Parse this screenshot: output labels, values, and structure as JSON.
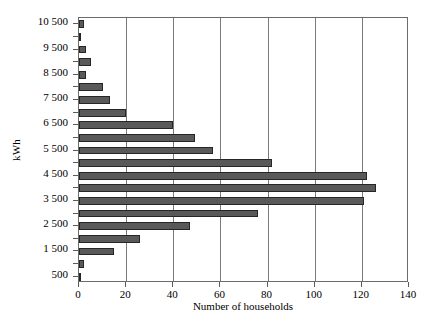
{
  "chart_data": {
    "type": "bar",
    "orientation": "horizontal",
    "title": "",
    "xlabel": "Number of households",
    "ylabel": "kWh",
    "xlim": [
      0,
      140
    ],
    "ylim_note": "categorical bins from 500 to 10 500 kWh in 500 kWh steps",
    "grid": "vertical gridlines at every x tick",
    "legend": "none",
    "xticks": [
      0,
      20,
      40,
      60,
      80,
      100,
      120,
      140
    ],
    "xticklabels": [
      "0",
      "20",
      "40",
      "60",
      "80",
      "100",
      "120",
      "140"
    ],
    "categories": [
      "10 500",
      "10 000",
      "9 500",
      "9 000",
      "8 500",
      "8 000",
      "7 500",
      "7 000",
      "6 500",
      "6 000",
      "5 500",
      "5 000",
      "4 500",
      "4 000",
      "3 500",
      "3 000",
      "2 500",
      "2 000",
      "1 500",
      "1 000",
      "500"
    ],
    "yticklabels_shown": [
      "10 500",
      "9 500",
      "8 500",
      "7 500",
      "6 500",
      "5 500",
      "4 500",
      "3 500",
      "2 500",
      "1 500",
      "500"
    ],
    "values": [
      2,
      1,
      3,
      5,
      3,
      10,
      13,
      20,
      40,
      49,
      57,
      82,
      122,
      126,
      121,
      76,
      47,
      26,
      15,
      2,
      1
    ],
    "bar_color": "#595959",
    "bar_edge_color": "#262626",
    "axis_color": "#6b6b6b",
    "background_color": "#ffffff"
  }
}
